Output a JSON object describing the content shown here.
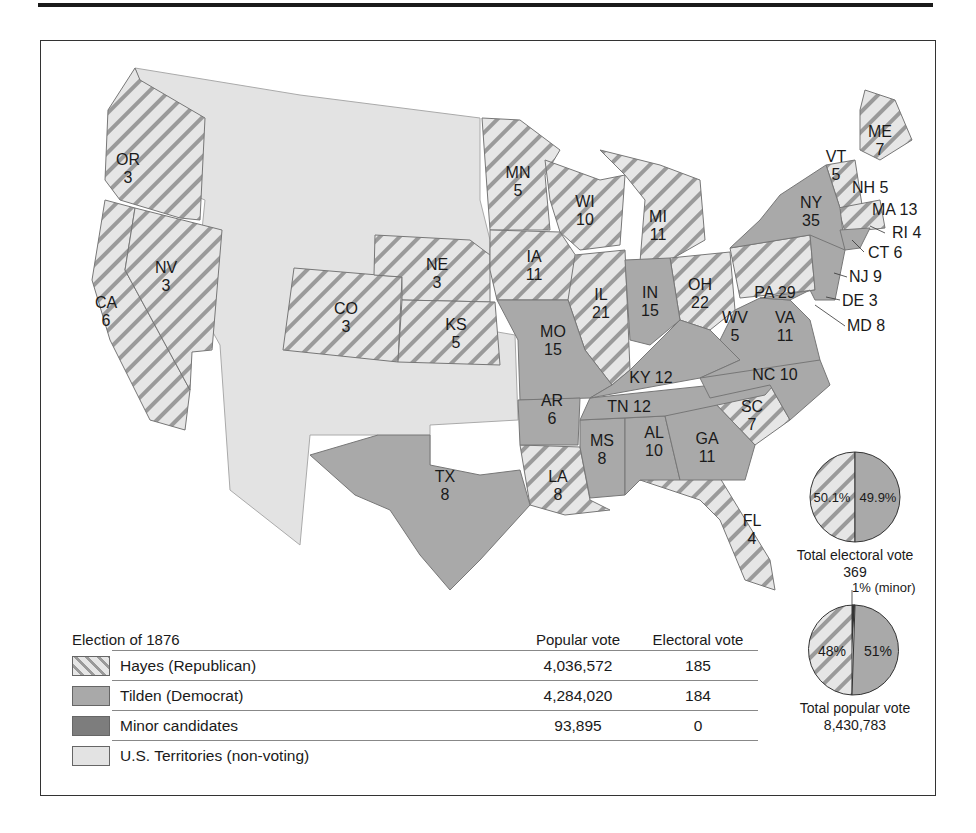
{
  "title": "Election of 1876",
  "legend": {
    "title": "Election of 1876",
    "col_popular": "Popular vote",
    "col_electoral": "Electoral vote",
    "rows": [
      {
        "label": "Hayes (Republican)",
        "popular": "4,036,572",
        "electoral": "185",
        "pattern": "hatched"
      },
      {
        "label": "Tilden (Democrat)",
        "popular": "4,284,020",
        "electoral": "184",
        "color": "#a9a9a9"
      },
      {
        "label": "Minor candidates",
        "popular": "93,895",
        "electoral": "0",
        "color": "#7d7d7d"
      },
      {
        "label": "U.S. Territories (non-voting)",
        "popular": "",
        "electoral": "",
        "color": "#e3e3e3"
      }
    ]
  },
  "states": {
    "OR": {
      "abbr": "OR",
      "ev": "3",
      "party": "Hayes"
    },
    "CA": {
      "abbr": "CA",
      "ev": "6",
      "party": "Hayes"
    },
    "NV": {
      "abbr": "NV",
      "ev": "3",
      "party": "Hayes"
    },
    "CO": {
      "abbr": "CO",
      "ev": "3",
      "party": "Hayes"
    },
    "NE": {
      "abbr": "NE",
      "ev": "3",
      "party": "Hayes"
    },
    "KS": {
      "abbr": "KS",
      "ev": "5",
      "party": "Hayes"
    },
    "MN": {
      "abbr": "MN",
      "ev": "5",
      "party": "Hayes"
    },
    "IA": {
      "abbr": "IA",
      "ev": "11",
      "party": "Hayes"
    },
    "WI": {
      "abbr": "WI",
      "ev": "10",
      "party": "Hayes"
    },
    "IL": {
      "abbr": "IL",
      "ev": "21",
      "party": "Hayes"
    },
    "MI": {
      "abbr": "MI",
      "ev": "11",
      "party": "Hayes"
    },
    "OH": {
      "abbr": "OH",
      "ev": "22",
      "party": "Hayes"
    },
    "PA": {
      "abbr": "PA",
      "ev": "29",
      "party": "Hayes"
    },
    "SC": {
      "abbr": "SC",
      "ev": "7",
      "party": "Hayes"
    },
    "FL": {
      "abbr": "FL",
      "ev": "4",
      "party": "Hayes"
    },
    "LA": {
      "abbr": "LA",
      "ev": "8",
      "party": "Hayes"
    },
    "ME": {
      "abbr": "ME",
      "ev": "7",
      "party": "Hayes"
    },
    "VT": {
      "abbr": "VT",
      "ev": "5",
      "party": "Hayes"
    },
    "NH": {
      "abbr": "NH",
      "ev": "5",
      "party": "Hayes"
    },
    "MA": {
      "abbr": "MA",
      "ev": "13",
      "party": "Hayes"
    },
    "RI": {
      "abbr": "RI",
      "ev": "4",
      "party": "Hayes"
    },
    "MO": {
      "abbr": "MO",
      "ev": "15",
      "party": "Tilden"
    },
    "AR": {
      "abbr": "AR",
      "ev": "6",
      "party": "Tilden"
    },
    "TX": {
      "abbr": "TX",
      "ev": "8",
      "party": "Tilden"
    },
    "MS": {
      "abbr": "MS",
      "ev": "8",
      "party": "Tilden"
    },
    "AL": {
      "abbr": "AL",
      "ev": "10",
      "party": "Tilden"
    },
    "GA": {
      "abbr": "GA",
      "ev": "11",
      "party": "Tilden"
    },
    "TN": {
      "abbr": "TN",
      "ev": "12",
      "party": "Tilden"
    },
    "KY": {
      "abbr": "KY",
      "ev": "12",
      "party": "Tilden"
    },
    "IN": {
      "abbr": "IN",
      "ev": "15",
      "party": "Tilden"
    },
    "WV": {
      "abbr": "WV",
      "ev": "5",
      "party": "Tilden"
    },
    "VA": {
      "abbr": "VA",
      "ev": "11",
      "party": "Tilden"
    },
    "NC": {
      "abbr": "NC",
      "ev": "10",
      "party": "Tilden"
    },
    "NY": {
      "abbr": "NY",
      "ev": "35",
      "party": "Tilden"
    },
    "NJ": {
      "abbr": "NJ",
      "ev": "9",
      "party": "Tilden"
    },
    "DE": {
      "abbr": "DE",
      "ev": "3",
      "party": "Tilden"
    },
    "MD": {
      "abbr": "MD",
      "ev": "8",
      "party": "Tilden"
    },
    "CT": {
      "abbr": "CT",
      "ev": "6",
      "party": "Tilden"
    }
  },
  "labels": {
    "OR": "OR",
    "OR_ev": "3",
    "CA": "CA",
    "CA_ev": "6",
    "NV": "NV",
    "NV_ev": "3",
    "CO": "CO",
    "CO_ev": "3",
    "NE": "NE",
    "NE_ev": "3",
    "KS": "KS",
    "KS_ev": "5",
    "MN": "MN",
    "MN_ev": "5",
    "IA": "IA",
    "IA_ev": "11",
    "WI": "WI",
    "WI_ev": "10",
    "IL": "IL",
    "IL_ev": "21",
    "MI": "MI",
    "MI_ev": "11",
    "IN": "IN",
    "IN_ev": "15",
    "OH": "OH",
    "OH_ev": "22",
    "MO": "MO",
    "MO_ev": "15",
    "AR": "AR",
    "AR_ev": "6",
    "TX": "TX",
    "TX_ev": "8",
    "LA": "LA",
    "LA_ev": "8",
    "MS": "MS",
    "MS_ev": "8",
    "AL": "AL",
    "AL_ev": "10",
    "GA": "GA",
    "GA_ev": "11",
    "SC": "SC",
    "SC_ev": "7",
    "FL": "FL",
    "FL_ev": "4",
    "WV": "WV",
    "WV_ev": "5",
    "VA": "VA",
    "VA_ev": "11",
    "NY": "NY",
    "NY_ev": "35",
    "ME": "ME",
    "ME_ev": "7",
    "VT": "VT",
    "VT_ev": "5",
    "KY": "KY 12",
    "TN": "TN 12",
    "NC": "NC 10",
    "PA": "PA 29",
    "NH": "NH 5",
    "MA": "MA 13",
    "RI": "RI 4",
    "CT": "CT 6",
    "NJ": "NJ 9",
    "DE": "DE 3",
    "MD": "MD 8"
  },
  "electoral_pie": {
    "hayes_pct": "50.1%",
    "tilden_pct": "49.9%",
    "caption": "Total electoral vote",
    "total": "369"
  },
  "popular_pie": {
    "hayes_pct": "48%",
    "tilden_pct": "51%",
    "minor_pct": "1% (minor)",
    "caption": "Total popular vote",
    "total": "8,430,783"
  },
  "colors": {
    "hayes_light": "#e6e6e6",
    "hayes_stripe": "#9a9a9a",
    "tilden": "#a9a9a9",
    "minor": "#7d7d7d",
    "territory": "#e3e3e3"
  }
}
